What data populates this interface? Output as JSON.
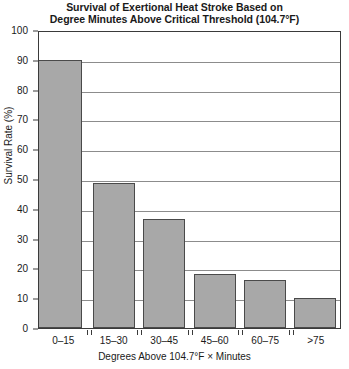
{
  "chart_data": {
    "type": "bar",
    "title": "Survival of Exertional Heat Stroke Based on Degree Minutes Above Critical Threshold (104.7°F)",
    "title_lines": [
      "Survival of Exertional Heat Stroke Based on",
      "Degree Minutes Above Critical Threshold (104.7°F)"
    ],
    "xlabel": "Degrees Above 104.7°F × Minutes",
    "ylabel": "Survival Rate (%)",
    "categories": [
      "0–15",
      "15–30",
      "30–45",
      "45–60",
      "60–75",
      ">75"
    ],
    "values": [
      90,
      48.5,
      36.5,
      18,
      16,
      10
    ],
    "ylim": [
      0,
      100
    ],
    "yticks": [
      0,
      10,
      20,
      30,
      40,
      50,
      60,
      70,
      80,
      90,
      100
    ],
    "ytick_labels": [
      "0",
      "10",
      "20",
      "30",
      "40",
      "50",
      "60",
      "70",
      "80",
      "90",
      "100"
    ],
    "grid": true,
    "grid_axis": "y",
    "legend": false,
    "bar_color": "#a8a8a8",
    "bar_edge_color": "#4a4a4a",
    "axis_color": "#3a3a3a",
    "grid_color": "#8c8c8c",
    "background_color": "#ffffff"
  }
}
